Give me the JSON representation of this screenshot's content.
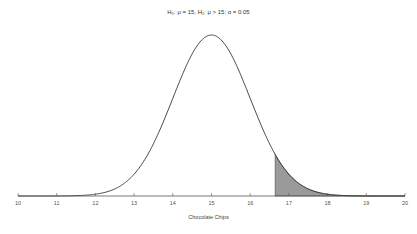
{
  "chart_data": {
    "type": "area",
    "title": "H₀: μ = 15, H₁: μ > 15; α = 0.05",
    "xlabel": "Chocolate Chips",
    "ylabel": "",
    "distribution": "normal",
    "mean": 15,
    "sd": 1,
    "alpha": 0.05,
    "tail": "right",
    "critical_value": 16.645,
    "xlim": [
      10,
      20
    ],
    "x_ticks": [
      10,
      11,
      12,
      13,
      14,
      15,
      16,
      17,
      18,
      19,
      20
    ],
    "grid": false,
    "legend": null,
    "curve_color": "#333333",
    "shade_color": "#9a9a9a",
    "axis_color": "#555555"
  }
}
